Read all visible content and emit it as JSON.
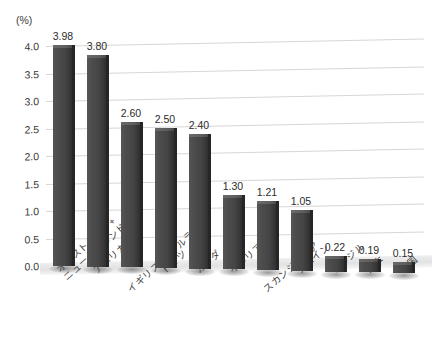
{
  "chart_data": {
    "type": "bar",
    "title": "",
    "subtitle": "",
    "xlabel": "",
    "ylabel": "(%)",
    "unit_label": "(%)",
    "ylim": [
      0,
      4.3
    ],
    "yticks": [
      "0.0",
      "0.5",
      "1.0",
      "1.5",
      "2.0",
      "2.5",
      "3.0",
      "3.5",
      "4.0"
    ],
    "ytick_values": [
      0.0,
      0.5,
      1.0,
      1.5,
      2.0,
      2.5,
      3.0,
      3.5,
      4.0
    ],
    "grid": true,
    "legend": "none",
    "style": "3d-column",
    "bar_color": "#4a4a4a",
    "gridline_color": "#d6d6d6",
    "categories": [
      "オーストラリア+\nニュージーランド",
      "アメリカ",
      "イギリス+アイルランド",
      "ドイツ",
      "カナダ",
      "イタリア",
      "スカンジナビア",
      "スペイン",
      "ブラジル",
      "日本",
      "中国"
    ],
    "values": [
      3.98,
      3.8,
      2.6,
      2.5,
      2.4,
      1.3,
      1.21,
      1.05,
      0.22,
      0.19,
      0.15
    ],
    "value_labels": [
      "3.98",
      "3.80",
      "2.60",
      "2.50",
      "2.40",
      "1.30",
      "1.21",
      "1.05",
      "0.22",
      "0.19",
      "0.15"
    ],
    "category_lines": [
      [
        "オーストラリア+",
        "ニュージーランド"
      ],
      [
        "アメリカ"
      ],
      [
        "イギリス+アイルランド"
      ],
      [
        "ドイツ"
      ],
      [
        "カナダ"
      ],
      [
        "イタリア"
      ],
      [
        "スカンジナビア"
      ],
      [
        "スペイン"
      ],
      [
        "ブラジル"
      ],
      [
        "日本"
      ],
      [
        "中国"
      ]
    ],
    "category_stagger": [
      0,
      0,
      1,
      0,
      0,
      0,
      1,
      0,
      0,
      0,
      0
    ]
  },
  "caption": {
    "partial_text": ""
  }
}
